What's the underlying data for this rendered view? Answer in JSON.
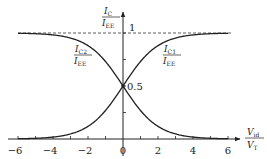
{
  "chart_data": {
    "type": "line",
    "title": "",
    "xlabel": "V_id / V_T",
    "ylabel": "I_C / I_EE",
    "xlim": [
      -6,
      6
    ],
    "ylim": [
      0,
      1
    ],
    "grid": false,
    "x_ticks": [
      -6,
      -5,
      -4,
      -3,
      -2,
      -1,
      0,
      1,
      2,
      3,
      4,
      5,
      6
    ],
    "x_tick_labels": [
      "−6",
      "−4",
      "−2",
      "0",
      "2",
      "4",
      "6"
    ],
    "x_tick_label_values": [
      -6,
      -4,
      -2,
      0,
      2,
      4,
      6
    ],
    "y_ticks": [
      0.25,
      0.5,
      0.75,
      1
    ],
    "y_tick_labels": [
      "0.5",
      "1"
    ],
    "asymptote": {
      "y": 1,
      "style": "dashed"
    },
    "series": [
      {
        "name": "I_C1 / I_EE",
        "formula": "1 / (1 + exp(-x))",
        "x": [
          -6,
          -5,
          -4,
          -3,
          -2,
          -1,
          0,
          1,
          2,
          3,
          4,
          5,
          6
        ],
        "values": [
          0.0025,
          0.0067,
          0.018,
          0.047,
          0.119,
          0.269,
          0.5,
          0.731,
          0.881,
          0.953,
          0.982,
          0.993,
          0.9975
        ]
      },
      {
        "name": "I_C2 / I_EE",
        "formula": "1 / (1 + exp(x))",
        "x": [
          -6,
          -5,
          -4,
          -3,
          -2,
          -1,
          0,
          1,
          2,
          3,
          4,
          5,
          6
        ],
        "values": [
          0.9975,
          0.993,
          0.982,
          0.953,
          0.881,
          0.731,
          0.5,
          0.269,
          0.119,
          0.047,
          0.018,
          0.0067,
          0.0025
        ]
      }
    ],
    "annotations": [
      {
        "text": "0.5",
        "at": [
          0,
          0.5
        ]
      },
      {
        "text": "1",
        "at": [
          0,
          1
        ]
      }
    ]
  },
  "labels": {
    "y_axis_num": "I",
    "y_axis_num_sub": "C",
    "y_axis_den": "I",
    "y_axis_den_sub": "EE",
    "x_axis_num": "V",
    "x_axis_num_sub": "id",
    "x_axis_den": "V",
    "x_axis_den_sub": "T",
    "c2_num": "I",
    "c2_num_sub": "C2",
    "c2_den": "I",
    "c2_den_sub": "EE",
    "c1_num": "I",
    "c1_num_sub": "C1",
    "c1_den": "I",
    "c1_den_sub": "EE",
    "half": "0.5",
    "one": "1"
  }
}
